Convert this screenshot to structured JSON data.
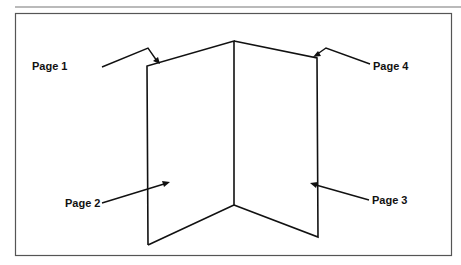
{
  "diagram": {
    "type": "folded-booklet-illustration",
    "colors": {
      "line": "#111111",
      "frame": "#555555",
      "rule": "#777777",
      "background": "#ffffff"
    },
    "labels": [
      {
        "id": "page-1",
        "text": "Page 1"
      },
      {
        "id": "page-2",
        "text": "Page 2"
      },
      {
        "id": "page-3",
        "text": "Page 3"
      },
      {
        "id": "page-4",
        "text": "Page 4"
      }
    ]
  }
}
